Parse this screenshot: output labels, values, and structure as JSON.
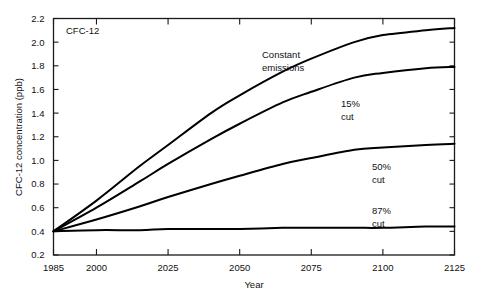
{
  "figure": {
    "panel_label": "CFC-12",
    "background_color": "#ffffff",
    "line_color": "#000000",
    "frame_color": "#1a1a1a"
  },
  "chart_data": {
    "type": "line",
    "title": "",
    "panel_label": "CFC-12",
    "xlabel": "Year",
    "ylabel": "CFC-12 concentration (ppb)",
    "xlim": [
      1985,
      2125
    ],
    "ylim": [
      0.2,
      2.2
    ],
    "xticks": [
      1985,
      2000,
      2025,
      2050,
      2075,
      2100,
      2125
    ],
    "xtick_labels": [
      "1985",
      "2000",
      "2025",
      "2050",
      "2075",
      "2100",
      "2125"
    ],
    "yticks": [
      0.2,
      0.4,
      0.6,
      0.8,
      1.0,
      1.2,
      1.4,
      1.6,
      1.8,
      2.0,
      2.2
    ],
    "ytick_labels": [
      "0.2",
      "0.4",
      "0.6",
      "0.8",
      "1.0",
      "1.2",
      "1.4",
      "1.6",
      "1.8",
      "2.0",
      "2.2"
    ],
    "grid": false,
    "legend": "inline annotations",
    "x": [
      1985,
      2000,
      2015,
      2025,
      2040,
      2050,
      2065,
      2075,
      2090,
      2100,
      2115,
      2125
    ],
    "series": [
      {
        "name": "Constant emissions",
        "label": "Constant\nemissions",
        "label_line1": "Constant",
        "label_line2": "emissions",
        "values": [
          0.4,
          0.66,
          0.95,
          1.13,
          1.4,
          1.55,
          1.75,
          1.86,
          2.0,
          2.06,
          2.1,
          2.12
        ]
      },
      {
        "name": "15% cut",
        "label": "15%\ncut",
        "label_line1": "15%",
        "label_line2": "cut",
        "values": [
          0.4,
          0.6,
          0.82,
          0.97,
          1.18,
          1.31,
          1.49,
          1.58,
          1.7,
          1.74,
          1.78,
          1.79
        ]
      },
      {
        "name": "50% cut",
        "label": "50%\ncut",
        "label_line1": "50%",
        "label_line2": "cut",
        "values": [
          0.4,
          0.5,
          0.61,
          0.69,
          0.8,
          0.87,
          0.97,
          1.02,
          1.09,
          1.11,
          1.13,
          1.14
        ]
      },
      {
        "name": "87% cut",
        "label": "87%\ncut",
        "label_line1": "87%",
        "label_line2": "cut",
        "values": [
          0.4,
          0.41,
          0.41,
          0.42,
          0.42,
          0.42,
          0.43,
          0.43,
          0.43,
          0.43,
          0.44,
          0.44
        ]
      }
    ],
    "annotations": [
      {
        "text": "Constant emissions",
        "near_year": 2060
      },
      {
        "text": "15% cut",
        "near_year": 2080
      },
      {
        "text": "50% cut",
        "near_year": 2095
      },
      {
        "text": "87% cut",
        "near_year": 2095
      }
    ]
  }
}
